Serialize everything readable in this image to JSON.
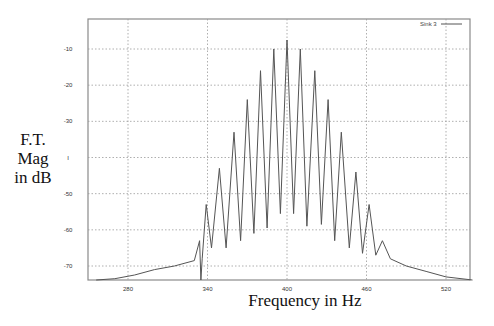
{
  "chart_data": {
    "type": "line",
    "title": "",
    "xlabel": "Frequency in Hz",
    "ylabel": "F.T. Mag in dB",
    "ylabel_lines": [
      "F.T.",
      "Mag",
      "in dB"
    ],
    "xlim": [
      254,
      549
    ],
    "ylim": [
      -74,
      -1
    ],
    "x_ticks": [
      280,
      340,
      400,
      460,
      520
    ],
    "x_tick_labels": [
      "280",
      "340",
      "400",
      "460",
      "520"
    ],
    "y_ticks": [
      -10,
      -20,
      -30,
      -40,
      -50,
      -60,
      -70
    ],
    "y_tick_labels": [
      "-10",
      "-20",
      "-30",
      "I",
      "-50",
      "-60",
      "-70"
    ],
    "grid": true,
    "grid_style": "dotted",
    "legend_position": "top-right",
    "series": [
      {
        "name": "Sink 3",
        "color": "#555555",
        "x": [
          256,
          270,
          285,
          300,
          315,
          330,
          334,
          335,
          336,
          339,
          343,
          349,
          354,
          360,
          365,
          370,
          375,
          380,
          385,
          390,
          395,
          400,
          405,
          410,
          415,
          421,
          426,
          431,
          436,
          441,
          447,
          452,
          457,
          462,
          467,
          472,
          478,
          490,
          505,
          520,
          540
        ],
        "y": [
          -74,
          -73.5,
          -72.5,
          -71,
          -70,
          -68.5,
          -63,
          -74,
          -68,
          -53,
          -65,
          -43,
          -65,
          -33,
          -63,
          -24,
          -61,
          -16,
          -59.5,
          -10,
          -55.5,
          -7.5,
          -55.5,
          -10,
          -59,
          -16,
          -58.5,
          -24,
          -63,
          -33,
          -65,
          -44,
          -66.5,
          -53,
          -67,
          -63,
          -68,
          -70,
          -71.5,
          -73,
          -74
        ]
      }
    ],
    "peaks": [
      {
        "hz": 339,
        "db": -53
      },
      {
        "hz": 349,
        "db": -43
      },
      {
        "hz": 360,
        "db": -33
      },
      {
        "hz": 370,
        "db": -24
      },
      {
        "hz": 380,
        "db": -16
      },
      {
        "hz": 390,
        "db": -10
      },
      {
        "hz": 400,
        "db": -7.5
      },
      {
        "hz": 410,
        "db": -10
      },
      {
        "hz": 421,
        "db": -16
      },
      {
        "hz": 431,
        "db": -24
      },
      {
        "hz": 441,
        "db": -33
      },
      {
        "hz": 452,
        "db": -44
      },
      {
        "hz": 462,
        "db": -53
      },
      {
        "hz": 472,
        "db": -63
      }
    ]
  },
  "legend": {
    "label": "Sink 3"
  },
  "axes": {
    "xlabel": "Frequency in Hz",
    "ylabel_line1": "F.T.",
    "ylabel_line2": "Mag",
    "ylabel_line3": "in dB"
  }
}
